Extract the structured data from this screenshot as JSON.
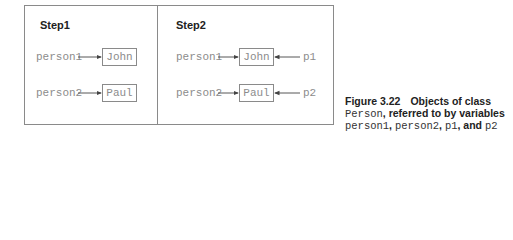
{
  "diagram": {
    "panels": [
      {
        "label": "Step1",
        "variables": [
          {
            "name": "person1",
            "refers_to": "John"
          },
          {
            "name": "person2",
            "refers_to": "Paul"
          }
        ],
        "objects": [
          "John",
          "Paul"
        ]
      },
      {
        "label": "Step2",
        "variables": [
          {
            "name": "person1",
            "refers_to": "John"
          },
          {
            "name": "person2",
            "refers_to": "Paul"
          },
          {
            "name": "p1",
            "refers_to": "John"
          },
          {
            "name": "p2",
            "refers_to": "Paul"
          }
        ],
        "objects": [
          "John",
          "Paul"
        ]
      }
    ],
    "colors": {
      "border": "#8a8a8a",
      "mono_text": "#8c8c8c",
      "label_text": "#222222"
    }
  },
  "caption": {
    "figure_number": "Figure 3.22",
    "line1_rest": "Objects of class",
    "class_name": "Person",
    "line2_rest": ", referred to by variables",
    "var1": "person1",
    "sep1": ", ",
    "var2": "person2",
    "sep2": ", ",
    "var3": "p1",
    "sep3": ", and ",
    "var4": "p2"
  }
}
